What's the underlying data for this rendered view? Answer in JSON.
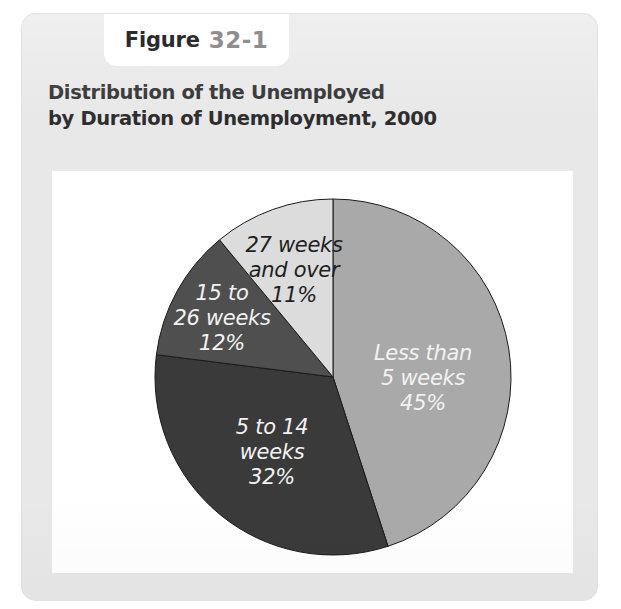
{
  "figure": {
    "tab_word": "Figure",
    "tab_number": "32-1",
    "title_line1": "Distribution of the Unemployed",
    "title_line2": "by Duration of Unemployment, 2000"
  },
  "colors": {
    "card_background": "#e8e8e8",
    "panel_background": "#ffffff",
    "title_text": "#2d2d2d",
    "tab_number_text": "#8e8e8e",
    "rule": "#242424",
    "slice_less_than_5": "#a9a9a9",
    "slice_5_to_14": "#3a3a3a",
    "slice_15_to_26": "#4f4f4f",
    "slice_27_and_over": "#dcdcdc",
    "slice_outline": "#1a1a1a"
  },
  "chart_data": {
    "type": "pie",
    "title": "Distribution of the Unemployed by Duration of Unemployment, 2000",
    "xlabel": "",
    "ylabel": "",
    "legend_position": "none",
    "grid": false,
    "units": "percent",
    "start_angle_deg": 0,
    "direction": "clockwise",
    "categories": [
      "Less than 5 weeks",
      "5 to 14 weeks",
      "15 to 26 weeks",
      "27 weeks and over"
    ],
    "values": [
      45,
      32,
      12,
      11
    ],
    "slices": [
      {
        "name": "Less than 5 weeks",
        "value": 45,
        "label": "Less than\n5 weeks\n45%",
        "color": "#a9a9a9",
        "text_color": "light"
      },
      {
        "name": "5 to 14 weeks",
        "value": 32,
        "label": "5 to 14\nweeks\n32%",
        "color": "#3a3a3a",
        "text_color": "light"
      },
      {
        "name": "15 to 26 weeks",
        "value": 12,
        "label": "15 to\n26 weeks\n12%",
        "color": "#4f4f4f",
        "text_color": "light"
      },
      {
        "name": "27 weeks and over",
        "value": 11,
        "label": "27 weeks\nand over\n11%",
        "color": "#dcdcdc",
        "text_color": "dark"
      }
    ]
  }
}
